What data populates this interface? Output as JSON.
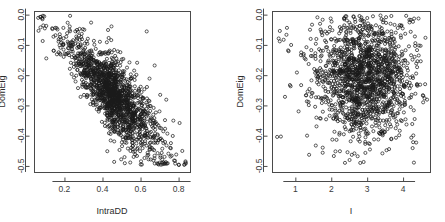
{
  "figure": {
    "background_color": "#ffffff",
    "point_color": "#1a1a1a",
    "axis_color": "#4a4a4a",
    "panel_count": 2
  },
  "chart_data": [
    {
      "type": "scatter",
      "title": "",
      "xlabel": "IntraDD",
      "ylabel": "DomEig",
      "xlim": [
        0.04,
        0.86
      ],
      "ylim": [
        -0.52,
        0.012
      ],
      "xticks": [
        0.2,
        0.4,
        0.6,
        0.8
      ],
      "xticklabels": [
        "0.2",
        "0.4",
        "0.6",
        "0.8"
      ],
      "yticks": [
        0.0,
        -0.1,
        -0.2,
        -0.3,
        -0.4,
        -0.5
      ],
      "yticklabels": [
        "0.0",
        "-0.1",
        "-0.2",
        "-0.3",
        "-0.4",
        "-0.5"
      ],
      "grid": false,
      "legend": "none",
      "marker": "open-circle",
      "n_points": 1600,
      "description": "Dense negatively-sloped elongated cloud running from upper-left (low IntraDD, DomEig near 0.0) to lower-right (high IntraDD, DomEig near -0.5), with scattered outliers to the right.",
      "relationship": "negative",
      "generator": {
        "kind": "linear-band",
        "x_min": 0.05,
        "x_max": 0.84,
        "x_mode": 0.42,
        "slope": -0.62,
        "intercept": 0.02,
        "noise_sd": 0.042,
        "outlier_fraction": 0.04,
        "seed": 20240517
      }
    },
    {
      "type": "scatter",
      "title": "",
      "xlabel": "I",
      "ylabel": "DomEig",
      "xlim": [
        0.35,
        4.75
      ],
      "ylim": [
        -0.52,
        0.012
      ],
      "xticks": [
        1,
        2,
        3,
        4
      ],
      "xticklabels": [
        "1",
        "2",
        "3",
        "4"
      ],
      "yticks": [
        0.0,
        -0.1,
        -0.2,
        -0.3,
        -0.4,
        -0.5
      ],
      "yticklabels": [
        "0.0",
        "-0.1",
        "-0.2",
        "-0.3",
        "-0.4",
        "-0.5"
      ],
      "grid": false,
      "legend": "none",
      "marker": "open-circle",
      "n_points": 1600,
      "description": "Roughly circular dense blob centred near I = 2.9, DomEig = -0.21, with a diffuse halo of scattered points extending to both sides; no clear trend.",
      "relationship": "none",
      "generator": {
        "kind": "blob",
        "x_center": 2.9,
        "x_sd": 0.62,
        "y_center": -0.205,
        "y_sd": 0.095,
        "x_min": 0.4,
        "x_max": 4.7,
        "y_min": -0.49,
        "y_max": -0.002,
        "halo_fraction": 0.22,
        "seed": 7781234
      }
    }
  ]
}
